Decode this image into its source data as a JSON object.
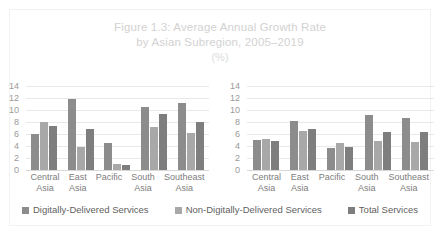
{
  "figure": {
    "title_line1": "Figure 1.3: Average Annual Growth Rate",
    "title_line2": "by Asian Subregion, 2005–2019",
    "units": "(%)"
  },
  "legend": {
    "items": [
      {
        "label": "Digitally-Delivered Services",
        "color": "#8c8c8c"
      },
      {
        "label": "Non-Digitally-Delivered Services",
        "color": "#a8a8a8"
      },
      {
        "label": "Total Services",
        "color": "#7e7e7e"
      }
    ]
  },
  "chart_data": [
    {
      "type": "bar",
      "title": "Figure 1.3: Average Annual Growth Rate by Asian Subregion, 2005–2019",
      "panel": "left",
      "xlabel": "",
      "ylabel": "",
      "ylim": [
        0,
        14
      ],
      "yticks": [
        14,
        12,
        10,
        8,
        6,
        4,
        2,
        0
      ],
      "grid": true,
      "legend_position": "bottom",
      "categories": [
        "Central Asia",
        "East Asia",
        "Pacific",
        "South Asia",
        "Southeast Asia"
      ],
      "series": [
        {
          "name": "Digitally-Delivered Services",
          "color": "#8c8c8c",
          "values": [
            6.0,
            11.8,
            4.5,
            10.5,
            11.2
          ]
        },
        {
          "name": "Non-Digitally-Delivered Services",
          "color": "#a8a8a8",
          "values": [
            8.0,
            3.8,
            1.0,
            7.2,
            6.1
          ]
        },
        {
          "name": "Total Services",
          "color": "#7e7e7e",
          "values": [
            7.4,
            6.8,
            0.9,
            9.4,
            8.0
          ]
        }
      ]
    },
    {
      "type": "bar",
      "title": "Figure 1.3: Average Annual Growth Rate by Asian Subregion, 2005–2019",
      "panel": "right",
      "xlabel": "",
      "ylabel": "",
      "ylim": [
        0,
        14
      ],
      "yticks": [
        14,
        12,
        10,
        8,
        6,
        4,
        2,
        0
      ],
      "grid": true,
      "legend_position": "bottom",
      "categories": [
        "Central Asia",
        "East Asia",
        "Pacific",
        "South Asia",
        "Southeast Asia"
      ],
      "series": [
        {
          "name": "Digitally-Delivered Services",
          "color": "#8c8c8c",
          "values": [
            5.0,
            8.2,
            3.7,
            9.1,
            8.6
          ]
        },
        {
          "name": "Non-Digitally-Delivered Services",
          "color": "#a8a8a8",
          "values": [
            5.2,
            6.5,
            4.5,
            4.8,
            4.6
          ]
        },
        {
          "name": "Total Services",
          "color": "#7e7e7e",
          "values": [
            4.9,
            6.9,
            3.8,
            6.4,
            6.3
          ]
        }
      ]
    }
  ]
}
